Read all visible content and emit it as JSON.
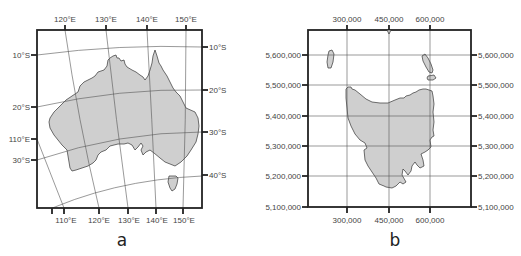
{
  "colors": {
    "land": "#cfcfcf",
    "coast": "#333333",
    "frame": "#222222",
    "grid": "#555555",
    "label": "#444444"
  },
  "panel_a": {
    "caption": "a",
    "subject": "Australia (geographic graticule)",
    "top_labels": [
      "120°E",
      "130°E",
      "140°E",
      "150°E"
    ],
    "bottom_labels": [
      "110°E",
      "120°E",
      "130°E",
      "140°E",
      "150°E"
    ],
    "left_labels": [
      "10°S",
      "20°S",
      "110°E",
      "30°S"
    ],
    "right_labels": [
      "10°S",
      "20°S",
      "30°S",
      "40°S"
    ]
  },
  "panel_b": {
    "caption": "b",
    "subject": "Tasmania (projected grid)",
    "top_labels": [
      "300,000",
      "450,000",
      "600,000"
    ],
    "bottom_labels": [
      "300,000",
      "450,000",
      "600,000"
    ],
    "left_labels": [
      "5,600,000",
      "5,500,000",
      "5,400,000",
      "5,300,000",
      "5,200,000",
      "5,100,000"
    ],
    "right_labels": [
      "5,600,000",
      "5,500,000",
      "5,400,000",
      "5,300,000",
      "5,200,000",
      "5,100,000"
    ]
  }
}
